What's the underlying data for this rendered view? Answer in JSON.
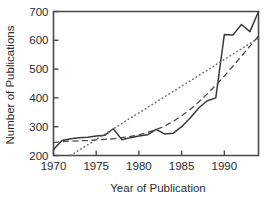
{
  "chart_data": {
    "type": "line",
    "title": "",
    "xlabel": "Year of Publication",
    "ylabel": "Number of Publications",
    "xlim": [
      1970,
      1994
    ],
    "ylim": [
      200,
      700
    ],
    "xticks": [
      1970,
      1975,
      1980,
      1985,
      1990
    ],
    "yticks": [
      200,
      300,
      400,
      500,
      600,
      700
    ],
    "xtick_labels": [
      "1970",
      "1975",
      "1980",
      "1985",
      "1990"
    ],
    "ytick_labels": [
      "200",
      "300",
      "400",
      "500",
      "600",
      "700"
    ],
    "grid": false,
    "legend": "none",
    "x": [
      1970,
      1971,
      1972,
      1973,
      1974,
      1975,
      1976,
      1977,
      1978,
      1979,
      1980,
      1981,
      1982,
      1983,
      1984,
      1985,
      1986,
      1987,
      1988,
      1989,
      1990,
      1991,
      1992,
      1993,
      1994
    ],
    "series": [
      {
        "name": "Number of Publications",
        "style": "solid",
        "color": "#3a3a3a",
        "values": [
          221,
          252,
          258,
          262,
          263,
          268,
          270,
          293,
          255,
          262,
          268,
          272,
          291,
          275,
          277,
          300,
          330,
          365,
          390,
          400,
          420,
          423,
          480,
          555,
          620
        ]
      },
      {
        "name": "Smoothed trend",
        "style": "dashed",
        "color": "#4a4a4a",
        "values": [
          245,
          248,
          250,
          251,
          252,
          254,
          256,
          258,
          262,
          266,
          272,
          280,
          290,
          302,
          318,
          338,
          360,
          386,
          414,
          444,
          476,
          510,
          545,
          580,
          615
        ]
      },
      {
        "name": "Linear trend",
        "style": "dotted",
        "color": "#6a6a6a",
        "values": [
          null,
          null,
          200,
          219,
          237,
          256,
          274,
          293,
          311,
          330,
          348,
          367,
          385,
          404,
          422,
          441,
          459,
          478,
          496,
          515,
          533,
          552,
          570,
          589,
          607
        ]
      }
    ],
    "series_solid_tail": {
      "x": [
        1990,
        1991,
        1992,
        1993,
        1994
      ],
      "values": [
        620,
        618,
        655,
        630,
        700
      ]
    }
  }
}
